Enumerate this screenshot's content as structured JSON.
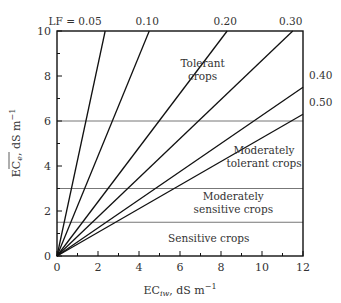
{
  "chart_data": {
    "type": "line",
    "title": "",
    "xlabel": "EC_iw, dS m^-1",
    "ylabel": "EC_e (mean), dS m^-1",
    "xlim": [
      0,
      12
    ],
    "ylim": [
      0,
      10
    ],
    "xticks": [
      0,
      2,
      4,
      6,
      8,
      10,
      12
    ],
    "yticks": [
      0,
      2,
      4,
      6,
      8,
      10
    ],
    "grid": false,
    "series": [
      {
        "name": "LF = 0.05",
        "label": "LF = 0.05",
        "x": [
          0,
          2.35
        ],
        "y": [
          0,
          10
        ]
      },
      {
        "name": "LF = 0.10",
        "label": "0.10",
        "x": [
          0,
          4.5
        ],
        "y": [
          0,
          10
        ]
      },
      {
        "name": "LF = 0.20",
        "label": "0.20",
        "x": [
          0,
          8.3
        ],
        "y": [
          0,
          10
        ]
      },
      {
        "name": "LF = 0.30",
        "label": "0.30",
        "x": [
          0,
          11.5
        ],
        "y": [
          0,
          10
        ]
      },
      {
        "name": "LF = 0.40",
        "label": "0.40",
        "x": [
          0,
          12
        ],
        "y": [
          0,
          7.5
        ]
      },
      {
        "name": "LF = 0.50",
        "label": "0.50",
        "x": [
          0,
          12
        ],
        "y": [
          0,
          6.3
        ]
      }
    ],
    "thresholds": [
      {
        "y": 6,
        "name": "tolerant boundary"
      },
      {
        "y": 3,
        "name": "moderately tolerant boundary"
      },
      {
        "y": 1.5,
        "name": "moderately sensitive boundary"
      }
    ],
    "zones": [
      {
        "label_lines": [
          "Tolerant",
          "crops"
        ],
        "x": 7.1,
        "y": 8.2
      },
      {
        "label_lines": [
          "Moderately",
          "tolerant crops"
        ],
        "x": 10.1,
        "y": 4.3
      },
      {
        "label_lines": [
          "Moderately",
          "sensitive crops"
        ],
        "x": 8.6,
        "y": 2.25
      },
      {
        "label_lines": [
          "Sensitive crops"
        ],
        "x": 7.4,
        "y": 0.75
      }
    ]
  },
  "axis": {
    "x_title_main": "EC",
    "x_title_sub": "iw",
    "x_title_unit": ", dS m",
    "x_title_exp": "−1",
    "y_title_main": "EC",
    "y_title_sub": "e",
    "y_title_unit": ", dS m",
    "y_title_exp": "−1"
  }
}
